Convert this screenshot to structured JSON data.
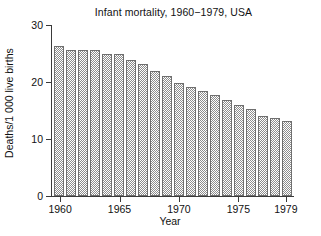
{
  "chart_data": {
    "type": "bar",
    "title": "Infant mortality, 1960−1979, USA",
    "xlabel": "Year",
    "ylabel": "Deaths/1 000 live births",
    "categories": [
      "1960",
      "1961",
      "1962",
      "1963",
      "1964",
      "1965",
      "1966",
      "1967",
      "1968",
      "1969",
      "1970",
      "1971",
      "1972",
      "1973",
      "1974",
      "1975",
      "1976",
      "1977",
      "1978",
      "1979"
    ],
    "values": [
      26.4,
      25.6,
      25.6,
      25.6,
      25.0,
      25.0,
      23.9,
      23.1,
      21.9,
      21.0,
      19.9,
      19.1,
      18.5,
      17.8,
      16.8,
      16.0,
      15.2,
      14.1,
      13.6,
      13.1
    ],
    "xlim": [
      1959.4,
      1979.6
    ],
    "ylim": [
      0,
      30
    ],
    "ytick_values": [
      0,
      10,
      20,
      30
    ],
    "ytick_labels": [
      "0",
      "10",
      "20",
      "30"
    ],
    "xtick_values": [
      1960,
      1965,
      1970,
      1975,
      1979
    ],
    "xtick_labels": [
      "1960",
      "1965",
      "1970",
      "1975",
      "1979"
    ],
    "grid": false,
    "legend": null,
    "bar_fill": "#8d8d8d",
    "bar_edge": "#6f6f6f",
    "axis_color": "#3a3a3a",
    "background": "#ffffff"
  }
}
